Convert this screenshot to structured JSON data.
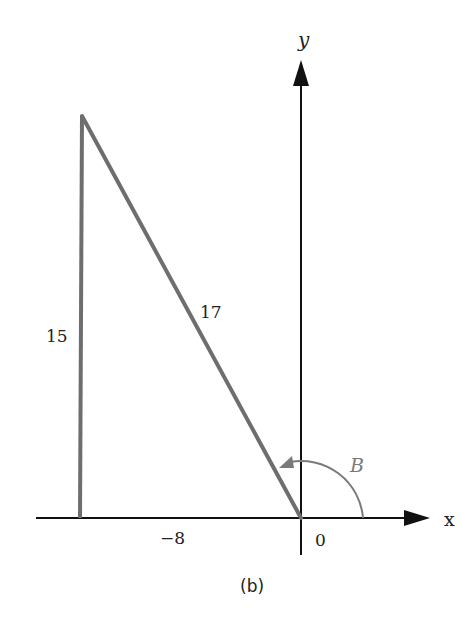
{
  "diagram": {
    "caption": "(b)",
    "axes": {
      "x_label": "x",
      "y_label": "y",
      "origin_label": "0"
    },
    "triangle": {
      "vertical_side_label": "15",
      "hypotenuse_label": "17",
      "base_label": "−8"
    },
    "angle": {
      "label": "B",
      "color": "#7a7a7a"
    },
    "colors": {
      "axis": "#111111",
      "triangle": "#6e6e6e"
    }
  }
}
